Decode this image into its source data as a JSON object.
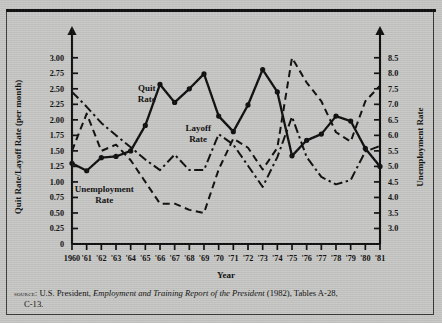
{
  "figure": {
    "background_color": "#c9c9c7",
    "ink_color": "#111111"
  },
  "source_note": {
    "prefix": "source:",
    "text_before_italic": " U.S. President, ",
    "italic_title": "Employment and Training Report of the President",
    "text_after_italic": " (1982), Tables A-28,",
    "continuation": "C-13."
  },
  "chart_data": {
    "type": "line",
    "title": "",
    "xlabel": "Year",
    "ylabel": "Quit Rate/Layoff Rate (per month)",
    "y2label": "Unemployment Rate",
    "grid": false,
    "legend": "inline-annotations",
    "x": [
      1960,
      1961,
      1962,
      1963,
      1964,
      1965,
      1966,
      1967,
      1968,
      1969,
      1970,
      1971,
      1972,
      1973,
      1974,
      1975,
      1976,
      1977,
      1978,
      1979,
      1980,
      1981
    ],
    "categories": [
      "1960",
      "'61",
      "'62",
      "'63",
      "'64",
      "'65",
      "'66",
      "'67",
      "'68",
      "'69",
      "'70",
      "'71",
      "'72",
      "'73",
      "'74",
      "'75",
      "'76",
      "'77",
      "'78",
      "'79",
      "'80",
      "'81"
    ],
    "ylim": [
      0,
      3.125
    ],
    "yticks": [
      0,
      0.25,
      0.5,
      0.75,
      1.0,
      1.25,
      1.5,
      1.75,
      2.0,
      2.25,
      2.5,
      2.75,
      3.0
    ],
    "yticklabels": [
      "0",
      "0.25",
      "0.50",
      "0.75",
      "1.00",
      "1.25",
      "1.50",
      "1.75",
      "2.00",
      "2.25",
      "2.50",
      "2.75",
      "3.00"
    ],
    "y2lim": [
      2.5,
      8.75
    ],
    "y2ticks": [
      3.0,
      3.5,
      4.0,
      4.5,
      5.0,
      5.5,
      6.0,
      6.5,
      7.0,
      7.5,
      8.0,
      8.5
    ],
    "y2ticklabels": [
      "3.0",
      "3.5",
      "4.0",
      "4.5",
      "5.0",
      "5.5",
      "6.0",
      "6.5",
      "7.0",
      "7.5",
      "8.0",
      "8.5"
    ],
    "series": [
      {
        "name": "Quit Rate",
        "axis": "left",
        "style": "solid",
        "markers": true,
        "label_position": {
          "x": 1965.1,
          "y": 2.46
        },
        "values": [
          1.3,
          1.18,
          1.39,
          1.41,
          1.5,
          1.91,
          2.57,
          2.28,
          2.5,
          2.74,
          2.06,
          1.81,
          2.24,
          2.81,
          2.45,
          1.42,
          1.67,
          1.77,
          2.06,
          1.98,
          1.54,
          1.25
        ]
      },
      {
        "name": "Layoff Rate",
        "axis": "left",
        "style": "dashdot",
        "markers": false,
        "label_position": {
          "x": 1968.6,
          "y": 1.82
        },
        "values": [
          2.45,
          2.21,
          1.95,
          1.75,
          1.56,
          1.36,
          1.19,
          1.44,
          1.19,
          1.19,
          1.77,
          1.6,
          1.26,
          0.92,
          1.4,
          2.05,
          1.4,
          1.08,
          0.96,
          1.03,
          1.49,
          1.58
        ]
      },
      {
        "name": "Unemployment Rate",
        "axis": "right",
        "style": "dashed",
        "markers": false,
        "label_position": {
          "x": 1962.2,
          "y": 0.83
        },
        "values": [
          5.5,
          6.7,
          5.5,
          5.7,
          5.2,
          4.5,
          3.8,
          3.8,
          3.6,
          3.5,
          4.9,
          5.9,
          5.6,
          4.9,
          5.6,
          8.5,
          7.7,
          7.1,
          6.1,
          5.8,
          7.1,
          7.6
        ]
      }
    ]
  }
}
